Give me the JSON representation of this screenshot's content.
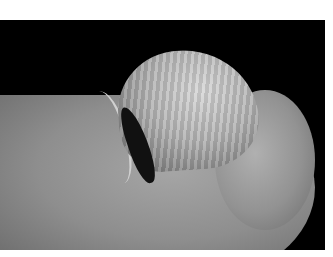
{
  "image": {
    "description": "Grayscale clinical photograph of a fingertip with a thickened, curved, ridged dystrophic nail plate lifting from the nail bed, on a black background with white border",
    "background_color": "#000000",
    "frame_color": "#ffffff",
    "subjects": [
      "finger",
      "fingertip",
      "dystrophic-nail",
      "nail-fold"
    ]
  }
}
